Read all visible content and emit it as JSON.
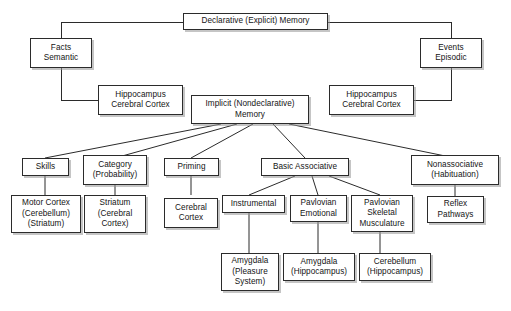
{
  "diagram": {
    "type": "hierarchy-tree",
    "colors": {
      "background": "#ffffff",
      "box_fill": "#ffffff",
      "box_border": "#2b2b2b",
      "box_shadow": "#969696",
      "connector": "#2b2b2b",
      "text": "#141414"
    },
    "nodes": {
      "declarative": "Declarative (Explicit) Memory",
      "facts_semantic": "Facts\nSemantic",
      "events_episodic": "Events\nEpisodic",
      "hippocampus_left": "Hippocampus\nCerebral Cortex",
      "hippocampus_right": "Hippocampus\nCerebral Cortex",
      "implicit": "Implicit (Nondeclarative)\nMemory",
      "skills": "Skills",
      "category": "Category\n(Probability)",
      "priming": "Priming",
      "basic_associative": "Basic Associative",
      "nonassociative": "Nonassociative\n(Habituation)",
      "motor_cortex": "Motor Cortex\n(Cerebellum)\n(Striatum)",
      "striatum": "Striatum\n(Cerebral\nCortex)",
      "cerebral_cortex": "Cerebral\nCortex",
      "instrumental": "Instrumental",
      "pavlovian_emotional": "Pavlovian\nEmotional",
      "pavlovian_skeletal": "Pavlovian\nSkeletal\nMusculature",
      "reflex_pathways": "Reflex\nPathways",
      "amygdala_pleasure": "Amygdala\n(Pleasure\nSystem)",
      "amygdala_hippocampus": "Amygdala\n(Hippocampus)",
      "cerebellum_hippocampus": "Cerebellum\n(Hippocampus)"
    }
  }
}
